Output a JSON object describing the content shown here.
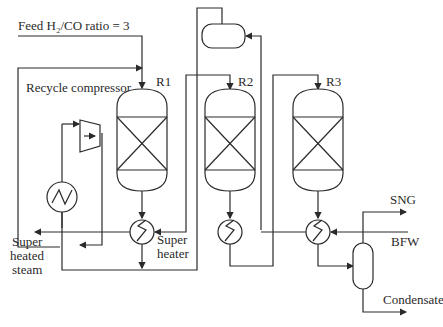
{
  "diagram": {
    "type": "process-flow",
    "labels": {
      "feed": "Feed H₂/CO ratio = 3",
      "recycle_compressor": "Recycle compressor",
      "r1": "R1",
      "r2": "R2",
      "r3": "R3",
      "sng": "SNG",
      "bfw": "BFW",
      "condensate": "Condensate",
      "super_heater_1": "Super",
      "super_heater_2": "heater",
      "steam_1": "Super",
      "steam_2": "heated",
      "steam_3": "steam"
    },
    "equipment": [
      {
        "id": "R1",
        "kind": "reactor"
      },
      {
        "id": "R2",
        "kind": "reactor"
      },
      {
        "id": "R3",
        "kind": "reactor"
      },
      {
        "id": "recycle-compressor",
        "kind": "compressor"
      },
      {
        "id": "recycle-cooler",
        "kind": "heat-exchanger"
      },
      {
        "id": "super-heater",
        "kind": "heat-exchanger"
      },
      {
        "id": "hx-r2",
        "kind": "heat-exchanger"
      },
      {
        "id": "hx-r3",
        "kind": "heat-exchanger"
      },
      {
        "id": "steam-drum",
        "kind": "drum"
      },
      {
        "id": "separator",
        "kind": "flash-separator"
      }
    ],
    "colors": {
      "line": "#2a2a2a",
      "background": "#ffffff"
    }
  }
}
